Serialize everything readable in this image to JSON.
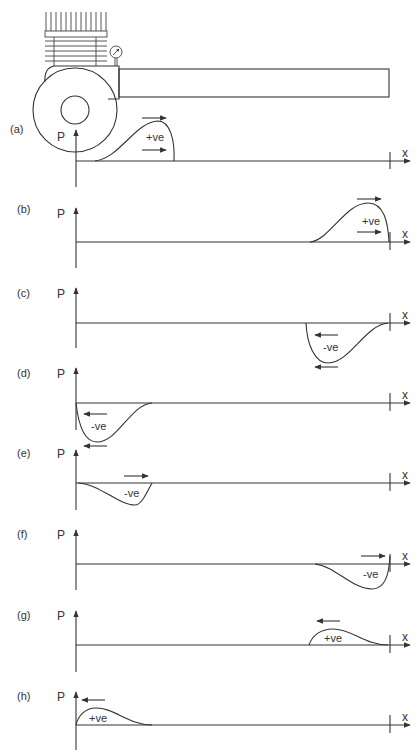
{
  "figure": {
    "apparatus": {
      "components": [
        "cooling-fins",
        "cylinder",
        "pressure-gauge",
        "flywheel",
        "pipe"
      ]
    },
    "axis_labels": {
      "y": "P",
      "x": "x"
    },
    "panels": [
      {
        "id": "a",
        "label": "(a)",
        "sign": "+ve",
        "wave": "positive",
        "position": "near-origin",
        "arrows": [
          "right",
          "right"
        ]
      },
      {
        "id": "b",
        "label": "(b)",
        "sign": "+ve",
        "wave": "positive",
        "position": "at-end",
        "arrows": [
          "right",
          "right"
        ]
      },
      {
        "id": "c",
        "label": "(c)",
        "sign": "-ve",
        "wave": "negative",
        "position": "at-end",
        "arrows": [
          "left",
          "left"
        ]
      },
      {
        "id": "d",
        "label": "(d)",
        "sign": "-ve",
        "wave": "negative",
        "position": "near-origin",
        "arrows": [
          "left",
          "left"
        ]
      },
      {
        "id": "e",
        "label": "(e)",
        "sign": "-ve",
        "wave": "negative",
        "position": "near-origin",
        "arrows": [
          "right"
        ]
      },
      {
        "id": "f",
        "label": "(f)",
        "sign": "-ve",
        "wave": "negative",
        "position": "at-end",
        "arrows": [
          "right"
        ]
      },
      {
        "id": "g",
        "label": "(g)",
        "sign": "+ve",
        "wave": "positive",
        "position": "at-end",
        "arrows": [
          "left"
        ]
      },
      {
        "id": "h",
        "label": "(h)",
        "sign": "+ve",
        "wave": "positive",
        "position": "near-origin",
        "arrows": [
          "left"
        ]
      }
    ]
  }
}
